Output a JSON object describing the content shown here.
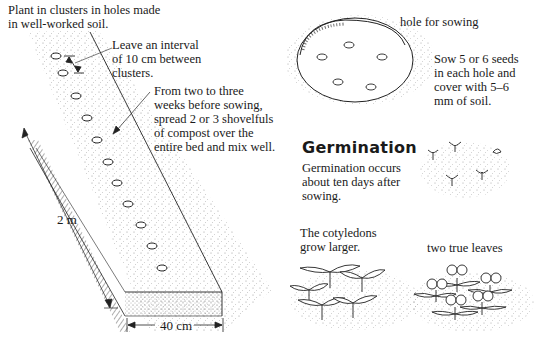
{
  "bed_panel": {
    "caption_plant": "Plant in clusters in holes made\nin well-worked soil.",
    "caption_interval": "Leave an interval\nof 10 cm between\nclusters.",
    "caption_compost": "From two to three\nweeks before sowing,\nspread 2 or 3 shovelfuls\nof compost over the\nentire bed and mix well.",
    "dimension_length": "2 m",
    "dimension_width": "40 cm",
    "hole_count": 11
  },
  "hole_panel": {
    "label": "hole for sowing",
    "caption": "Sow 5 or 6 seeds\nin each hole and\ncover with 5–6\nmm of soil.",
    "seed_count": 5
  },
  "germination_panel": {
    "heading": "Germination",
    "caption": "Germination occurs\nabout ten days after\nsowing."
  },
  "cotyledon_panel": {
    "caption": "The cotyledons\ngrow larger."
  },
  "true_leaves_panel": {
    "caption": "two true leaves"
  },
  "colors": {
    "ink": "#1a1a1a",
    "background": "#ffffff",
    "stipple": "#8a8a8a"
  }
}
